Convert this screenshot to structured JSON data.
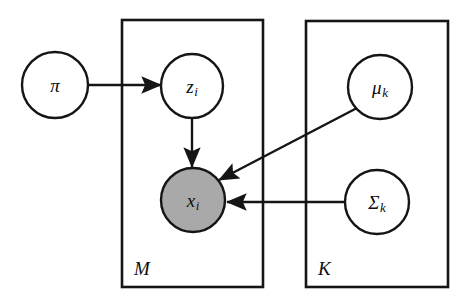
{
  "figure": {
    "type": "plate-notation-graphical-model",
    "background_color": "#ffffff",
    "stroke_color": "#151515",
    "shaded_node_color": "#a9a9a9",
    "open_node_color": "#ffffff"
  },
  "nodes": [
    {
      "id": "pi",
      "label": "π",
      "subscript": "",
      "shaded": false,
      "cx": 55,
      "cy": 85,
      "rx": 33,
      "ry": 33
    },
    {
      "id": "z_i",
      "label": "z",
      "subscript": "i",
      "shaded": false,
      "cx": 192,
      "cy": 86,
      "rx": 31,
      "ry": 32
    },
    {
      "id": "x_i",
      "label": "x",
      "subscript": "i",
      "shaded": true,
      "cx": 193,
      "cy": 200,
      "rx": 32,
      "ry": 32
    },
    {
      "id": "mu_k",
      "label": "μ",
      "subscript": "k",
      "shaded": false,
      "cx": 380,
      "cy": 87,
      "rx": 32,
      "ry": 32
    },
    {
      "id": "sigma_k",
      "label": "Σ",
      "subscript": "k",
      "shaded": false,
      "cx": 377,
      "cy": 202,
      "rx": 32,
      "ry": 32
    }
  ],
  "plates": [
    {
      "id": "plate_M",
      "label": "M",
      "x": 122,
      "y": 20,
      "width": 141,
      "height": 267,
      "label_x": 134,
      "label_y": 268
    },
    {
      "id": "plate_K",
      "label": "K",
      "x": 306,
      "y": 21,
      "width": 142,
      "height": 266,
      "label_x": 318,
      "label_y": 268
    }
  ],
  "edges": [
    {
      "id": "pi-to-z",
      "from": "pi",
      "to": "z_i",
      "x1": 89,
      "y1": 85,
      "x2": 161,
      "y2": 85,
      "arrow": "end"
    },
    {
      "id": "z-to-x",
      "from": "z_i",
      "to": "x_i",
      "x1": 192,
      "y1": 119,
      "x2": 192,
      "y2": 167,
      "arrow": "end"
    },
    {
      "id": "mu-to-x",
      "from": "mu_k",
      "to": "x_i",
      "x1": 357,
      "y1": 108,
      "x2": 219,
      "y2": 180,
      "arrow": "end"
    },
    {
      "id": "sigma-to-x",
      "from": "sigma_k",
      "to": "x_i",
      "x1": 345,
      "y1": 202,
      "x2": 227,
      "y2": 202,
      "arrow": "end"
    }
  ],
  "chart_data": {
    "type": "diagram",
    "nodes": [
      {
        "name": "π",
        "observed": false,
        "plate": null
      },
      {
        "name": "z_i",
        "observed": false,
        "plate": "M"
      },
      {
        "name": "x_i",
        "observed": true,
        "plate": "M"
      },
      {
        "name": "μ_k",
        "observed": false,
        "plate": "K"
      },
      {
        "name": "Σ_k",
        "observed": false,
        "plate": "K"
      }
    ],
    "directed_edges": [
      [
        "π",
        "z_i"
      ],
      [
        "z_i",
        "x_i"
      ],
      [
        "μ_k",
        "x_i"
      ],
      [
        "Σ_k",
        "x_i"
      ]
    ],
    "plates": [
      {
        "label": "M",
        "contains": [
          "z_i",
          "x_i"
        ]
      },
      {
        "label": "K",
        "contains": [
          "μ_k",
          "Σ_k"
        ]
      }
    ],
    "legend": "Shaded node indicates an observed variable."
  }
}
